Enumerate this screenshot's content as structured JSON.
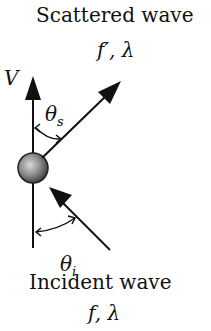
{
  "diagram": {
    "title_top": "Scattered wave",
    "scattered_params": "f′, λ",
    "velocity_label": "V",
    "theta_s_label": "θ",
    "theta_s_sub": "s",
    "theta_i_label": "θ",
    "theta_i_sub": "i",
    "title_bottom": "Incident wave",
    "incident_params": "f, λ"
  }
}
